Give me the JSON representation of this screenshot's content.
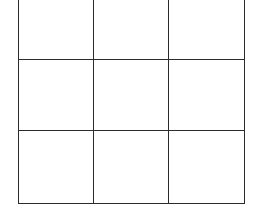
{
  "grid": {
    "rows": 3,
    "columns": 3,
    "line_color": "#2b2b2b",
    "background": "#ffffff",
    "cells": [
      [
        "",
        "",
        ""
      ],
      [
        "",
        "",
        ""
      ],
      [
        "",
        "",
        ""
      ]
    ]
  }
}
